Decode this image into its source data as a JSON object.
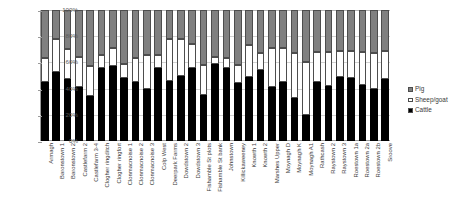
{
  "chart_data": {
    "type": "bar",
    "stacked": true,
    "normalized_percent": true,
    "title": "",
    "subtitle": "",
    "xlabel": "",
    "ylabel": "",
    "ylim": [
      0,
      100
    ],
    "yticks": [
      "0%",
      "20%",
      "40%",
      "60%",
      "80%",
      "100%"
    ],
    "ytick_values": [
      0,
      20,
      40,
      60,
      80,
      100
    ],
    "grid": true,
    "legend_position": "right",
    "legend": [
      "Pig",
      "Sheep/goat",
      "Cattle"
    ],
    "categories": [
      "Armagh",
      "Baronstown 1",
      "Baronstown 2",
      "Castlefarm 2",
      "Castlefarm 3-4",
      "Clogher ringditch",
      "Clogher ringfort",
      "Clonmacnoise 1",
      "Clonmacnoise 2",
      "Clonmacnoise 3",
      "Colp West",
      "Deerpark Farms",
      "Dowdstown 2",
      "Dowdstown 3",
      "Fishamble St plots",
      "Fishamble St bank",
      "Johnstown",
      "Killickaweeney",
      "Knowth 1",
      "Knowth 2",
      "Marshes Upper",
      "Moynagh D",
      "Moynagh K",
      "Moynagh A1",
      "Rathcash",
      "Raystown 2",
      "Raystown 3",
      "Roestown 1a",
      "Roestown 2a",
      "Roestown 2b",
      "Sroove"
    ],
    "series": [
      {
        "name": "Cattle",
        "color": "#000000",
        "values": [
          45,
          53,
          47,
          41,
          34,
          56,
          57,
          48,
          45,
          40,
          56,
          46,
          50,
          56,
          35,
          59,
          56,
          44,
          49,
          54,
          41,
          45,
          33,
          20,
          45,
          42,
          49,
          48,
          43,
          40,
          47
        ]
      },
      {
        "name": "Sheep/goat",
        "color": "#ffffff",
        "values": [
          18,
          25,
          23,
          23,
          23,
          10,
          14,
          11,
          18,
          26,
          10,
          32,
          28,
          18,
          23,
          5,
          7,
          14,
          24,
          13,
          30,
          26,
          34,
          40,
          23,
          26,
          20,
          21,
          25,
          27,
          22
        ]
      },
      {
        "name": "Pig",
        "color": "#808080",
        "values": [
          37,
          22,
          30,
          36,
          43,
          34,
          29,
          41,
          37,
          34,
          34,
          22,
          22,
          26,
          42,
          36,
          37,
          42,
          27,
          33,
          29,
          29,
          33,
          40,
          32,
          32,
          31,
          31,
          32,
          33,
          31
        ]
      }
    ]
  }
}
